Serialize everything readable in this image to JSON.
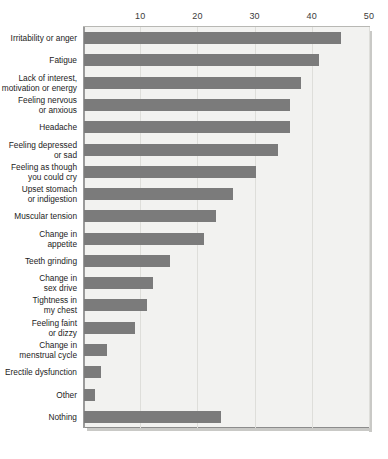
{
  "chart_data": {
    "type": "bar",
    "orientation": "horizontal",
    "title": "",
    "subtitle": "",
    "xlabel": "",
    "ylabel": "",
    "xlim": [
      0,
      50
    ],
    "ylim": null,
    "grid": true,
    "legend": null,
    "xticks": [
      "10",
      "20",
      "30",
      "40",
      "50"
    ],
    "xtick_values": [
      10,
      20,
      30,
      40,
      50
    ],
    "categories": [
      "Irritability or anger",
      "Fatigue",
      "Lack of interest,\nmotivation or energy",
      "Feeling nervous\nor anxious",
      "Headache",
      "Feeling depressed\nor sad",
      "Feeling as though\nyou could cry",
      "Upset stomach\nor indigestion",
      "Muscular tension",
      "Change in\nappetite",
      "Teeth grinding",
      "Change in\nsex drive",
      "Tightness in\nmy chest",
      "Feeling faint\nor dizzy",
      "Change in\nmenstrual cycle",
      "Erectile dysfunction",
      "Other",
      "Nothing"
    ],
    "values": [
      45,
      41,
      38,
      36,
      36,
      34,
      30,
      26,
      23,
      21,
      15,
      12,
      11,
      9,
      4,
      3,
      2,
      24
    ],
    "colors": {
      "bar": "#7b7b7b",
      "plot_background": "#f2f2f0",
      "gridline": "#dededa",
      "axis": "#8c8c8c",
      "tick_label": "#3b3b3b",
      "category_label": "#1c1c1c"
    }
  }
}
